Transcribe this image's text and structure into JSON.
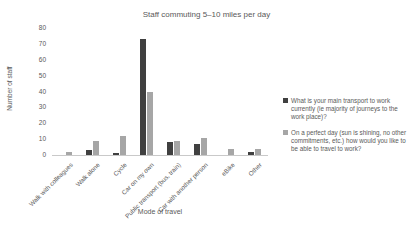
{
  "chart_data": {
    "type": "bar",
    "title": "Staff commuting 5–10 miles per day",
    "xlabel": "Mode of travel",
    "ylabel": "Number of staff",
    "categories": [
      "Walk with colleagues",
      "Walk alone",
      "Cycle",
      "Car on my own",
      "Public transport (bus, train)",
      "Car with another person",
      "eBike",
      "Other"
    ],
    "series": [
      {
        "name": "What is your main transport to work currently (ie majority of journeys to the work place)?",
        "color": "#404040",
        "values": [
          0,
          3,
          1,
          73,
          8,
          7,
          0,
          2
        ]
      },
      {
        "name": "On a perfect day (sun is shining, no other commitments, etc.) how would you like to be able to travel to work?",
        "color": "#a6a6a6",
        "values": [
          2,
          9,
          12,
          40,
          9,
          11,
          4,
          4
        ]
      }
    ],
    "ylim": [
      0,
      80
    ],
    "ytick_step": 10,
    "grid": false,
    "legend_position": "right",
    "text_color": "#595959",
    "axis_line_color": "#c9c9c9"
  }
}
